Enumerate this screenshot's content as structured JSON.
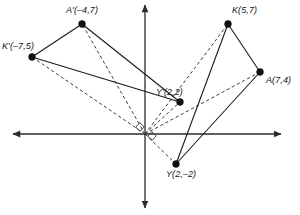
{
  "figure": {
    "width": 300,
    "height": 215,
    "background": "#ffffff",
    "stroke_color": "#1a1a1a",
    "dash_color": "#3a3a3a",
    "axis_color": "#2b2b2b"
  },
  "axes": {
    "origin_px": [
      145,
      134
    ],
    "unit_px_x": 16.1,
    "unit_px_y": 15.7,
    "x_axis": {
      "name": "x-axis",
      "from_px": [
        13,
        134
      ],
      "to_px": [
        281,
        134
      ],
      "arrows": "both"
    },
    "y_axis": {
      "name": "y-axis",
      "from_px": [
        145,
        5
      ],
      "to_px": [
        145,
        208
      ],
      "arrows": "both"
    }
  },
  "points": {
    "K": {
      "label": "K(5,7)",
      "x": 5,
      "y": 7,
      "px": [
        228,
        24
      ],
      "label_px": [
        232,
        6
      ]
    },
    "A": {
      "label": "A(7,4)",
      "x": 7,
      "y": 4,
      "px": [
        260,
        72
      ],
      "label_px": [
        266,
        76
      ]
    },
    "Y": {
      "label": "Y(2,–2)",
      "x": 2,
      "y": -2,
      "px": [
        176,
        164
      ],
      "label_px": [
        166,
        170
      ]
    },
    "Kp": {
      "label": "K'(–7,5)",
      "x": -7,
      "y": 5,
      "px": [
        32,
        57
      ],
      "label_px": [
        2,
        42
      ]
    },
    "Ap": {
      "label": "A'(–4,7)",
      "x": -4,
      "y": 7,
      "px": [
        82,
        24
      ],
      "label_px": [
        66,
        6
      ]
    },
    "Yp": {
      "label": "Y'(2,2)",
      "x": 2,
      "y": 2,
      "px": [
        180,
        102
      ],
      "label_px": [
        156,
        88
      ]
    }
  },
  "solid_segments": [
    {
      "name": "segment-K-A",
      "from": "K",
      "to": "A"
    },
    {
      "name": "segment-A-Y",
      "from": "A",
      "to": "Y"
    },
    {
      "name": "segment-Y-K",
      "from": "Y",
      "to": "K"
    },
    {
      "name": "segment-Kp-Ap",
      "from": "Kp",
      "to": "Ap"
    },
    {
      "name": "segment-Ap-Yp",
      "from": "Ap",
      "to": "Yp"
    },
    {
      "name": "segment-Yp-Kp",
      "from": "Yp",
      "to": "Kp"
    }
  ],
  "dashed_rays": [
    {
      "name": "ray-origin-K",
      "to": "K"
    },
    {
      "name": "ray-origin-A",
      "to": "A"
    },
    {
      "name": "ray-origin-Y",
      "to": "Y"
    },
    {
      "name": "ray-origin-Kp",
      "to": "Kp"
    },
    {
      "name": "ray-origin-Ap",
      "to": "Ap"
    },
    {
      "name": "ray-origin-Yp",
      "to": "Yp"
    }
  ],
  "right_angle_marks": [
    {
      "name": "right-angle-mark-upper-left",
      "cx": 140,
      "cy": 127,
      "size": 6.0,
      "rotate": 42
    },
    {
      "name": "right-angle-mark-lower-right",
      "cx": 152,
      "cy": 136,
      "size": 6.0,
      "rotate": 42
    }
  ],
  "chart_data": {
    "type": "scatter",
    "xlabel": "",
    "ylabel": "",
    "xlim": [
      -8.2,
      8.4
    ],
    "ylim": [
      -8.2,
      8.2
    ],
    "grid": false,
    "legend": "none",
    "series": [
      {
        "name": "Triangle KAY (pre-image)",
        "style": "solid",
        "labels": [
          "K(5,7)",
          "A(7,4)",
          "Y(2,–2)"
        ],
        "x": [
          5,
          7,
          2
        ],
        "y": [
          7,
          4,
          -2
        ]
      },
      {
        "name": "Triangle K'A'Y' (image)",
        "style": "solid",
        "labels": [
          "K'(–7,5)",
          "A'(–4,7)",
          "Y'(2,2)"
        ],
        "x": [
          -7,
          -4,
          2
        ],
        "y": [
          5,
          7,
          2
        ]
      }
    ],
    "annotations": [
      "Dashed rays connect the origin to each vertex and its image.",
      "Right-angle marks at the origin indicate a 90° rotation."
    ]
  }
}
